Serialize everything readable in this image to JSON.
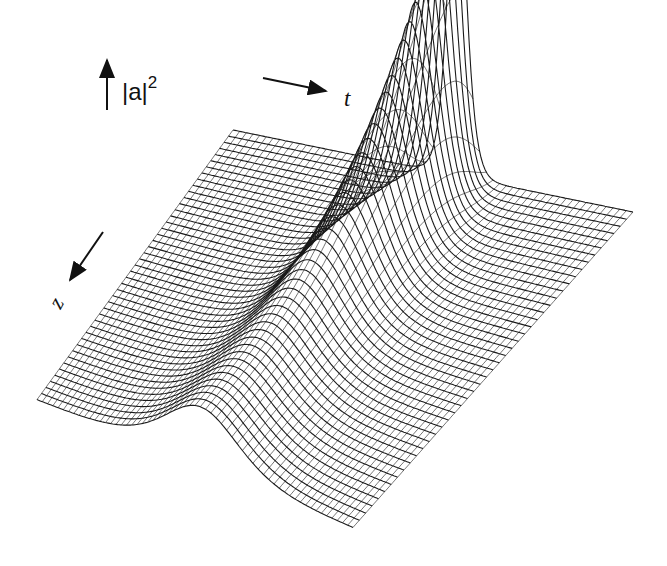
{
  "figure": {
    "type": "3d-wireframe-surface",
    "axes": {
      "vertical": {
        "label": "|a|",
        "superscript": "2",
        "arrow": "up"
      },
      "horizontal": {
        "label": "t",
        "arrow": "right"
      },
      "depth": {
        "label": "z",
        "arrow": "down-left"
      }
    },
    "colors": {
      "line": "#1a1a1a",
      "background": "#ffffff"
    }
  },
  "chart_data": {
    "type": "surface",
    "title": "",
    "xlabel": "t",
    "ylabel": "z",
    "zlabel": "|a|^2",
    "grid": {
      "t_lines": 60,
      "z_lines": 44
    },
    "pulse_profile": {
      "z_start_peak": 0.18,
      "z_end_peak": 1.0,
      "z_start_width": 0.16,
      "z_end_width": 0.03,
      "center_t_start": 0.52,
      "center_t_end": 0.56
    },
    "legend": []
  }
}
